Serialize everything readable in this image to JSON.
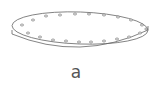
{
  "figure": {
    "label": "a",
    "hole_count": 20,
    "stroke_color": "#666666"
  }
}
